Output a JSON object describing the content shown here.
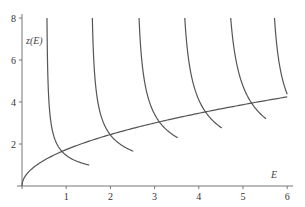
{
  "chart_data": {
    "type": "line",
    "title": "",
    "xlabel": "E",
    "ylabel": "z(E)",
    "xlim": [
      0,
      6
    ],
    "ylim": [
      0,
      8
    ],
    "grid": false,
    "legend": null,
    "x_ticks": [
      "1",
      "2",
      "3",
      "4",
      "5",
      "6"
    ],
    "y_ticks": [
      "2",
      "4",
      "6",
      "8"
    ],
    "series": [
      {
        "name": "rising curve z = sqrt(3E)",
        "kind": "rising",
        "formula": "z = sqrt(3*E)",
        "x_range": [
          0,
          6
        ],
        "points": [
          [
            0,
            0
          ],
          [
            0.25,
            0.87
          ],
          [
            0.5,
            1.22
          ],
          [
            1,
            1.73
          ],
          [
            2,
            2.45
          ],
          [
            3,
            3.0
          ],
          [
            4,
            3.46
          ],
          [
            5,
            3.87
          ],
          [
            6,
            4.24
          ]
        ]
      },
      {
        "name": "branch 1",
        "kind": "branch",
        "asymptote": 0.55,
        "k": 0.98,
        "x_end": 1.52,
        "end_z": 1.0
      },
      {
        "name": "branch 2",
        "kind": "branch",
        "asymptote": 1.55,
        "k": 1.63,
        "x_end": 2.52,
        "end_z": 1.67
      },
      {
        "name": "branch 3",
        "kind": "branch",
        "asymptote": 2.57,
        "k": 2.24,
        "x_end": 3.52,
        "end_z": 2.3
      },
      {
        "name": "branch 4",
        "kind": "branch",
        "asymptote": 3.57,
        "k": 2.69,
        "x_end": 4.52,
        "end_z": 2.76
      },
      {
        "name": "branch 5",
        "kind": "branch",
        "asymptote": 4.57,
        "k": 3.12,
        "x_end": 5.52,
        "end_z": 3.2
      },
      {
        "name": "branch 6",
        "kind": "branch",
        "asymptote": 5.59,
        "k": 2.8,
        "x_end": 6.0,
        "end_z": 4.38
      }
    ]
  },
  "plot": {
    "origin_px": [
      22,
      186
    ],
    "px_per_x": 44.2,
    "px_per_y": 21
  }
}
